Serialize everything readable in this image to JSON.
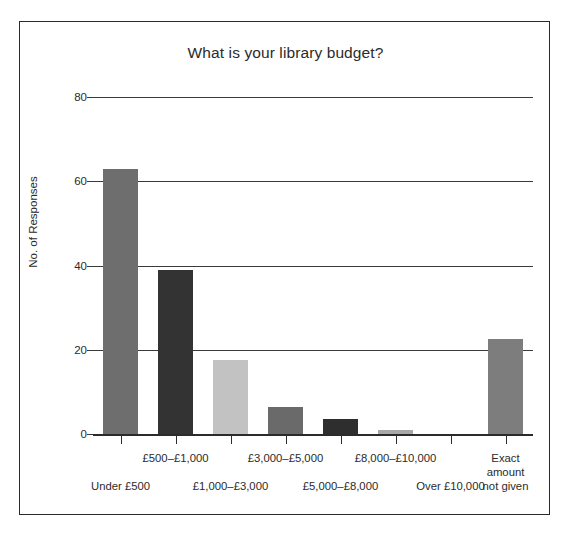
{
  "chart_data": {
    "type": "bar",
    "title": "What is your library budget?",
    "xlabel": "",
    "ylabel": "No. of Responses",
    "categories": [
      "Under £500",
      "£500–£1,000",
      "£1,000–£3,000",
      "£3,000–£5,000",
      "£5,000–£8,000",
      "£8,000–£10,000",
      "Over £10,000",
      "Exact amount\nnot given"
    ],
    "values": [
      63,
      39,
      17.5,
      6.5,
      3.5,
      1,
      0,
      22.5
    ],
    "bar_colors": [
      "#6e6e6e",
      "#333333",
      "#c2c2c2",
      "#6a6a6a",
      "#2e2e2e",
      "#a8a8a8",
      "#6e6e6e",
      "#7d7d7d"
    ],
    "ylim": [
      0,
      80
    ],
    "yticks": [
      0,
      20,
      40,
      60,
      80
    ],
    "ytick_labels": [
      "0",
      "20",
      "40",
      "60",
      "80"
    ],
    "grid": true,
    "grid_axis": "y",
    "legend": false,
    "legend_position": "none",
    "label_rows": [
      "bottom",
      "top",
      "bottom",
      "top",
      "bottom",
      "top",
      "bottom",
      "top"
    ],
    "frame": true
  },
  "figure": {
    "background_color": "#ffffff",
    "frame_color": "#2b2b2b",
    "text_color": "#2b2b2b"
  }
}
